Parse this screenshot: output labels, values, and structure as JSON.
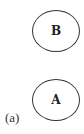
{
  "diagram": {
    "panel_label": "(a)",
    "nodes": [
      {
        "id": "B",
        "label": "B",
        "shape": "circle"
      },
      {
        "id": "A",
        "label": "A",
        "shape": "circle"
      }
    ],
    "edges": [],
    "colors": {
      "stroke": "#333333",
      "text": "#222222",
      "background": "#ffffff"
    }
  }
}
